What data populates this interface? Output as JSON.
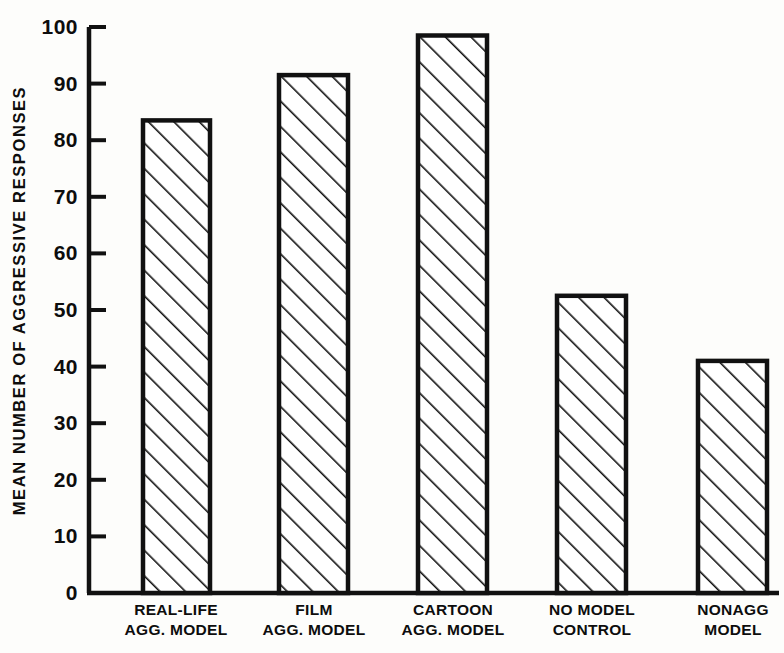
{
  "chart_data": {
    "type": "bar",
    "title": "",
    "subtitle": "",
    "xlabel": "",
    "ylabel": "MEAN NUMBER OF AGGRESSIVE RESPONSES",
    "ylim": [
      0,
      100
    ],
    "yticks": [
      0,
      10,
      20,
      30,
      40,
      50,
      60,
      70,
      80,
      90,
      100
    ],
    "ytick_labels": [
      "0",
      "10",
      "20",
      "30",
      "40",
      "50",
      "60",
      "70",
      "80",
      "90",
      "100"
    ],
    "grid": false,
    "legend": null,
    "bar_style": {
      "fill": "hatch-diagonal-forward",
      "edge_color": "#000000",
      "face_color": "#ffffff"
    },
    "categories": [
      "REAL-LIFE AGG. MODEL",
      "FILM AGG. MODEL",
      "CARTOON AGG. MODEL",
      "NO MODEL CONTROL",
      "NONAGG MODEL"
    ],
    "category_lines": [
      [
        "REAL-LIFE",
        "AGG. MODEL"
      ],
      [
        "FILM",
        "AGG. MODEL"
      ],
      [
        "CARTOON",
        "AGG. MODEL"
      ],
      [
        "NO MODEL",
        "CONTROL"
      ],
      [
        "NONAGG",
        "MODEL"
      ]
    ],
    "values": [
      83.5,
      91.5,
      98.5,
      52.5,
      41.0
    ],
    "series": [
      {
        "name": "Mean number of aggressive responses",
        "values": [
          83.5,
          91.5,
          98.5,
          52.5,
          41.0
        ]
      }
    ]
  }
}
